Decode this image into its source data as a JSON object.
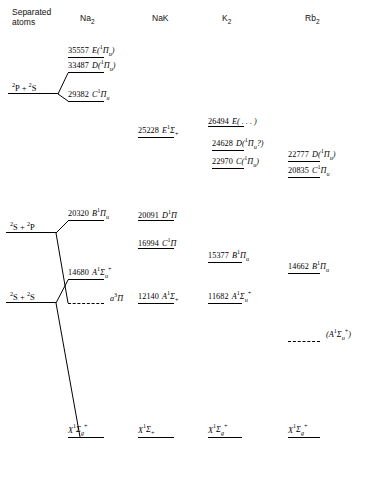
{
  "figure": {
    "type": "energy-level-diagram",
    "energy_unit": "cm^-1"
  },
  "columns": [
    {
      "id": "separated",
      "label_line1": "Separated",
      "label_line2": "atoms",
      "x": 12
    },
    {
      "id": "na2",
      "label": "Na",
      "sub": "2",
      "x": 80
    },
    {
      "id": "nak",
      "label": "NaK",
      "sub": "",
      "x": 152
    },
    {
      "id": "k2",
      "label": "K",
      "sub": "2",
      "x": 222
    },
    {
      "id": "rb2",
      "label": "Rb",
      "sub": "2",
      "x": 305
    }
  ],
  "separated_atom_limits": [
    {
      "id": "p-s",
      "label_html": "<sup>2</sup>P + <sup>2</sup>S",
      "x": 12,
      "y": 82,
      "bar_x": 8,
      "bar_w": 50,
      "bar_y": 94
    },
    {
      "id": "s-p",
      "label_html": "<sup>2</sup>S + <sup>2</sup>P",
      "x": 10,
      "y": 221,
      "bar_x": 6,
      "bar_w": 50,
      "bar_y": 233
    },
    {
      "id": "s-s",
      "label_html": "<sup>2</sup>S + <sup>2</sup>S",
      "x": 10,
      "y": 291,
      "bar_x": 6,
      "bar_w": 50,
      "bar_y": 303
    }
  ],
  "levels": {
    "na2": [
      {
        "energy": "35557",
        "term": "E",
        "state": "(<sup class=\"s\">1</sup>Π<sub class=\"s\">u</sub>)",
        "x": 68,
        "y": 57,
        "bar_w": 36,
        "dashed": false
      },
      {
        "energy": "33487",
        "term": "D",
        "state": "(<sup class=\"s\">1</sup>Π<sub class=\"s\">u</sub>)",
        "x": 68,
        "y": 72,
        "bar_w": 36,
        "dashed": false
      },
      {
        "energy": "29382",
        "term": "C",
        "state": "<sup class=\"s\">1</sup>Π<sub class=\"s\">u</sub>",
        "x": 68,
        "y": 101,
        "bar_w": 36,
        "dashed": false
      },
      {
        "energy": "20320",
        "term": "B",
        "state": "<sup class=\"s\">1</sup>Π<sub class=\"s\">u</sub>",
        "x": 68,
        "y": 220,
        "bar_w": 36,
        "dashed": false
      },
      {
        "energy": "14680",
        "term": "A",
        "state": "<sup class=\"s\">1</sup>Σ<sub class=\"s\">u</sub><span class=\"plus\">+</span>",
        "x": 68,
        "y": 279,
        "bar_w": 36,
        "dashed": false
      },
      {
        "energy": "",
        "term": "a",
        "state": "<sup class=\"s\">3</sup>Π",
        "x": 68,
        "y": 303,
        "bar_w": 36,
        "dashed": true
      },
      {
        "energy": "",
        "term": "X",
        "state": "<sup class=\"s\">1</sup>Σ<sub class=\"s\">g</sub><span class=\"plus\">+</span>",
        "x": 68,
        "y": 437,
        "bar_w": 36,
        "dashed": false,
        "ground": true
      }
    ],
    "nak": [
      {
        "energy": "25228",
        "term": "E",
        "state": "<sup class=\"s\">1</sup>Σ<sub class=\"n\">+</sub>",
        "x": 138,
        "y": 137,
        "bar_w": 36,
        "dashed": false
      },
      {
        "energy": "20091",
        "term": "D",
        "state": "<sup class=\"s\">1</sup>Π",
        "x": 138,
        "y": 220,
        "bar_w": 36,
        "dashed": false
      },
      {
        "energy": "16994",
        "term": "C",
        "state": "<sup class=\"s\">1</sup>Π",
        "x": 138,
        "y": 248,
        "bar_w": 36,
        "dashed": false
      },
      {
        "energy": "12140",
        "term": "A",
        "state": "<sup class=\"s\">1</sup>Σ<sub class=\"n\">+</sub>",
        "x": 138,
        "y": 303,
        "bar_w": 36,
        "dashed": false
      },
      {
        "energy": "",
        "term": "X",
        "state": "<sup class=\"s\">1</sup>Σ<sub class=\"n\">+</sub>",
        "x": 138,
        "y": 437,
        "bar_w": 36,
        "dashed": false,
        "ground": true
      }
    ],
    "k2": [
      {
        "energy": "26494",
        "term": "E",
        "state": "( . . . )",
        "x": 208,
        "y": 126,
        "bar_w": 36,
        "dashed": false
      },
      {
        "energy": "24628",
        "term": "D",
        "state": "(<sup class=\"s\">1</sup>Π<sub class=\"s\">u</sub>?)",
        "x": 212,
        "y": 150,
        "bar_w": 32,
        "dashed": false
      },
      {
        "energy": "22970",
        "term": "C",
        "state": "(<sup class=\"s\">1</sup>Π<sub class=\"s\">u</sub>)",
        "x": 212,
        "y": 168,
        "bar_w": 32,
        "dashed": false
      },
      {
        "energy": "15377",
        "term": "B",
        "state": "<sup class=\"s\">1</sup>Π<sub class=\"s\">u</sub>",
        "x": 208,
        "y": 262,
        "bar_w": 34,
        "dashed": false
      },
      {
        "energy": "11682",
        "term": "A",
        "state": "<sup class=\"s\">1</sup>Σ<sub class=\"s\">u</sub><span class=\"plus\">+</span>",
        "x": 208,
        "y": 303,
        "bar_w": 34,
        "dashed": false
      },
      {
        "energy": "",
        "term": "X",
        "state": "<sup class=\"s\">1</sup>Σ<sub class=\"s\">g</sub><span class=\"plus\">+</span>",
        "x": 208,
        "y": 437,
        "bar_w": 34,
        "dashed": false,
        "ground": true
      }
    ],
    "rb2": [
      {
        "energy": "22777",
        "term": "D",
        "state": "(<sup class=\"s\">1</sup>Π<sub class=\"s\">u</sub>)",
        "x": 288,
        "y": 161,
        "bar_w": 32,
        "dashed": false
      },
      {
        "energy": "20835",
        "term": "C",
        "state": "<sup class=\"s\">1</sup>Π<sub class=\"s\">u</sub>",
        "x": 288,
        "y": 177,
        "bar_w": 32,
        "dashed": false
      },
      {
        "energy": "14662",
        "term": "B",
        "state": "<sup class=\"s\">1</sup>Π<sub class=\"s\">u</sub>",
        "x": 288,
        "y": 273,
        "bar_w": 32,
        "dashed": false
      },
      {
        "energy": "",
        "term": "(A",
        "state": "<sup class=\"s\">1</sup>Σ<sub class=\"s\">u</sub><span class=\"plus\">+</span>)",
        "x": 288,
        "y": 341,
        "bar_w": 32,
        "dashed": true,
        "paren": true
      },
      {
        "energy": "",
        "term": "X",
        "state": "<sup class=\"s\">1</sup>Σ<sub class=\"s\">g</sub><span class=\"plus\">+</span>",
        "x": 288,
        "y": 437,
        "bar_w": 32,
        "dashed": false,
        "ground": true
      }
    ]
  },
  "connectors": [
    {
      "from": "2P+2S",
      "to": "Na2 D 33487",
      "points": "58,94 68,72"
    },
    {
      "from": "2P+2S",
      "to": "Na2 C 29382",
      "points": "58,94 68,101"
    },
    {
      "from": "2S+2P",
      "to": "Na2 B 20320",
      "points": "56,233 68,220"
    },
    {
      "from": "2S+2P",
      "to": "Na2 a3Pi",
      "points": "56,233 68,303"
    },
    {
      "from": "2S+2S",
      "to": "Na2 A 14680",
      "points": "56,303 68,279"
    },
    {
      "from": "2S+2S",
      "to": "Na2 X ground",
      "points": "56,303 80,437"
    }
  ]
}
